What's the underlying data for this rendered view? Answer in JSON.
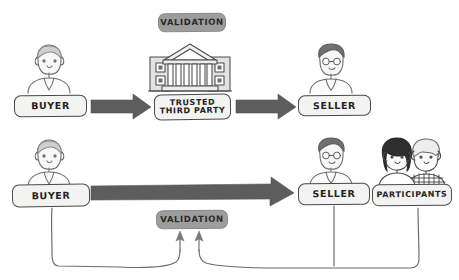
{
  "diagram": {
    "style": "hand-drawn sketch",
    "background_color": "#ffffff",
    "ink_color": "#4a4a4a",
    "arrow_color": "#5d5d5d",
    "pill_fill": "#f3f3f1",
    "pill_fill_dark": "#9d9d9d"
  },
  "row_centralized": {
    "buyer": {
      "label": "BUYER",
      "icon": "person-avatar-icon"
    },
    "intermediary": {
      "label_line1": "TRUSTED",
      "label_line2": "THIRD PARTY",
      "icon": "bank-building-icon"
    },
    "seller": {
      "label": "SELLER",
      "icon": "person-with-glasses-avatar-icon"
    },
    "validation": {
      "label": "VALIDATION"
    },
    "arrow_buyer_to_intermediary": {
      "icon": "arrow-right-icon"
    },
    "arrow_intermediary_to_seller": {
      "icon": "arrow-right-icon"
    }
  },
  "row_distributed": {
    "buyer": {
      "label": "BUYER",
      "icon": "person-avatar-icon"
    },
    "seller": {
      "label": "SELLER",
      "icon": "person-with-glasses-avatar-icon"
    },
    "participants": {
      "label": "PARTICIPANTS",
      "icon": "two-people-group-icon"
    },
    "validation": {
      "label": "VALIDATION"
    },
    "arrow_buyer_to_seller": {
      "icon": "long-arrow-right-icon"
    },
    "connector_arrowheads": {
      "icon": "arrow-up-icon",
      "count": 2
    }
  }
}
